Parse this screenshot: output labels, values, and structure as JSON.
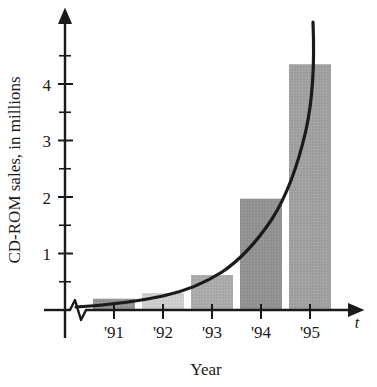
{
  "chart_data": {
    "type": "bar",
    "title": "",
    "subtitle": "",
    "xlabel": "Year",
    "ylabel": "CD-ROM sales, in millions",
    "x_variable_label": "t",
    "categories": [
      "'91",
      "'92",
      "'93",
      "'94",
      "'95"
    ],
    "values": [
      0.2,
      0.3,
      0.62,
      1.97,
      4.35
    ],
    "ylim": [
      0,
      4.75
    ],
    "y_major_ticks": [
      1,
      2,
      3,
      4
    ],
    "y_major_tick_labels": [
      "1",
      "2",
      "3",
      "4"
    ],
    "y_minor_ticks": [
      0.5,
      1.5,
      2.5,
      3.5,
      4.5
    ],
    "grid": false,
    "legend": null,
    "axis_break": "x-axis zigzag break near origin",
    "series": [
      {
        "name": "CD-ROM sales",
        "type": "bar",
        "values": [
          0.2,
          0.3,
          0.62,
          1.97,
          4.35
        ],
        "colors": [
          "#8f8f8f",
          "#c9c9c9",
          "#a8a8a8",
          "#8a8a8a",
          "#9e9e9e"
        ]
      },
      {
        "name": "exponential fit curve",
        "type": "line",
        "color": "#1a1a1a",
        "points": [
          [
            0.2,
            0.06
          ],
          [
            0.6,
            0.1
          ],
          [
            1.0,
            0.16
          ],
          [
            1.4,
            0.25
          ],
          [
            1.8,
            0.38
          ],
          [
            2.2,
            0.56
          ],
          [
            2.6,
            0.8
          ],
          [
            3.0,
            1.12
          ],
          [
            3.4,
            1.55
          ],
          [
            3.8,
            2.1
          ],
          [
            4.2,
            2.85
          ],
          [
            4.6,
            3.8
          ],
          [
            5.0,
            4.9
          ]
        ]
      }
    ]
  },
  "geometry": {
    "note": "pixel anchors used by the template renderer",
    "origin_x": 65,
    "origin_y": 310,
    "unit_px": 56.5,
    "category_tick_x": [
      114,
      163,
      212,
      261,
      310
    ],
    "bar_width_px": 42,
    "y_axis_top": 16,
    "x_axis_right": 356
  }
}
